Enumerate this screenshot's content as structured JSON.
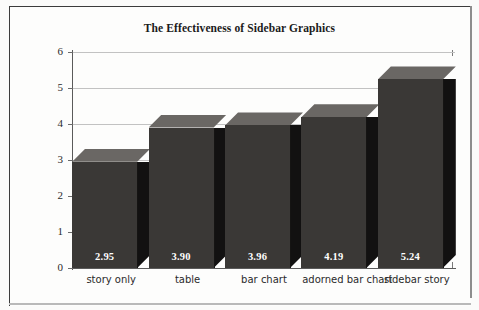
{
  "chart_data": {
    "type": "bar",
    "title": "The Effectiveness of Sidebar Graphics",
    "xlabel": "",
    "ylabel": "Accuracy",
    "categories": [
      "story only",
      "table",
      "bar chart",
      "adorned bar chart",
      "sidebar story"
    ],
    "values": [
      2.95,
      3.9,
      3.96,
      4.19,
      5.24
    ],
    "value_labels": [
      "2.95",
      "3.90",
      "3.96",
      "4.19",
      "5.24"
    ],
    "ylim": [
      0,
      6
    ],
    "yticks": [
      0,
      1,
      2,
      3,
      4,
      5,
      6
    ],
    "ytick_labels": [
      "0",
      "1",
      "2",
      "3",
      "4",
      "5",
      "6"
    ],
    "grid": true,
    "legend": null,
    "style": "3d-bar",
    "colors": {
      "bar_front": "#3a3836",
      "bar_side": "#121111",
      "bar_top": "#6a6764",
      "gridline": "#c2c2c2",
      "axis": "#5a5a5a",
      "value_text": "#ffffff",
      "background": "#fdfdfc"
    }
  }
}
